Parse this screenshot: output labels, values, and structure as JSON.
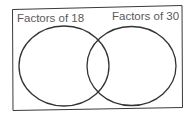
{
  "venn": {
    "sets": [
      {
        "label": "Factors of 18"
      },
      {
        "label": "Factors of 30"
      }
    ],
    "colors": {
      "stroke": "#333333",
      "label": "#5a5a5a",
      "background": "#ffffff"
    }
  }
}
